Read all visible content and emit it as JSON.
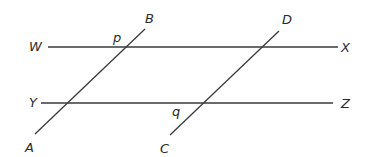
{
  "diagram": {
    "type": "geometry",
    "colors": {
      "stroke": "#3a3a3a",
      "label": "#2a2a2a",
      "background": "#ffffff"
    },
    "lines": [
      {
        "id": "WX",
        "x1": 48,
        "y1": 47,
        "x2": 338,
        "y2": 47
      },
      {
        "id": "YZ",
        "x1": 41,
        "y1": 103,
        "x2": 333,
        "y2": 103
      },
      {
        "id": "AB",
        "x1": 35,
        "y1": 134,
        "x2": 145,
        "y2": 29
      },
      {
        "id": "CD",
        "x1": 170,
        "y1": 135,
        "x2": 279,
        "y2": 31
      }
    ],
    "labels": {
      "W": {
        "text": "W",
        "x": 29,
        "y": 51
      },
      "X": {
        "text": "X",
        "x": 341,
        "y": 52
      },
      "Y": {
        "text": "Y",
        "x": 29,
        "y": 107
      },
      "Z": {
        "text": "Z",
        "x": 341,
        "y": 108
      },
      "A": {
        "text": "A",
        "x": 25,
        "y": 152
      },
      "B": {
        "text": "B",
        "x": 145,
        "y": 23
      },
      "C": {
        "text": "C",
        "x": 160,
        "y": 153
      },
      "D": {
        "text": "D",
        "x": 282,
        "y": 24
      },
      "p": {
        "text": "p",
        "x": 113,
        "y": 42
      },
      "q": {
        "text": "q",
        "x": 172,
        "y": 116
      }
    }
  }
}
